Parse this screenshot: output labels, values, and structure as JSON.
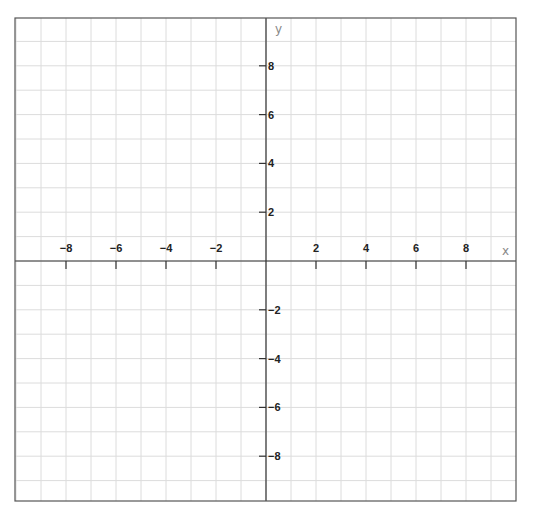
{
  "chart_data": {
    "type": "scatter",
    "title": "",
    "xlabel": "x",
    "ylabel": "y",
    "xlim": [
      -10,
      10
    ],
    "ylim": [
      -9.8,
      10
    ],
    "grid": true,
    "grid_step": 1,
    "x_ticks": [
      -8,
      -6,
      -4,
      -2,
      2,
      4,
      6,
      8
    ],
    "y_ticks": [
      8,
      6,
      4,
      2,
      -2,
      -4,
      -6,
      -8
    ],
    "x_tick_labels": [
      "-8",
      "-6",
      "-4",
      "-2",
      "2",
      "4",
      "6",
      "8"
    ],
    "y_tick_labels": [
      "8",
      "6",
      "4",
      "2",
      "-2",
      "-4",
      "-6",
      "-8"
    ],
    "series": [],
    "legend": []
  },
  "style": {
    "grid_color": "#dcdcdc",
    "axis_color": "#333333",
    "border_color": "#555555",
    "tick_label_color": "#222222",
    "axis_label_color": "#888888"
  },
  "layout": {
    "frame": {
      "left": 15,
      "top": 18,
      "right": 516,
      "bottom": 501
    },
    "origin": {
      "x": 266,
      "y": 261
    },
    "unit_px_x": 25,
    "unit_px_y": 24.4
  }
}
